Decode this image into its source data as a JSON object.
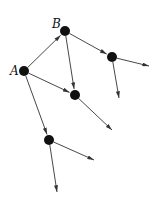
{
  "diagram": {
    "type": "directed-graph",
    "colors": {
      "node": "#111111",
      "edge": "#333333",
      "background": "#ffffff"
    },
    "nodes": [
      {
        "id": "A",
        "label": "A",
        "x": 24,
        "y": 71,
        "label_x": 10,
        "label_y": 75
      },
      {
        "id": "B",
        "label": "B",
        "x": 65,
        "y": 31,
        "label_x": 52,
        "label_y": 28
      },
      {
        "id": "C",
        "label": "",
        "x": 112,
        "y": 57
      },
      {
        "id": "D",
        "label": "",
        "x": 75,
        "y": 95
      },
      {
        "id": "E",
        "label": "",
        "x": 49,
        "y": 140
      }
    ],
    "edges": [
      {
        "from": "A",
        "to": "B"
      },
      {
        "from": "A",
        "to": "D"
      },
      {
        "from": "A",
        "to": "E"
      },
      {
        "from": "B",
        "to": "C"
      },
      {
        "from": "B",
        "to": "D"
      },
      {
        "from": "C",
        "to_point": [
          149,
          66
        ]
      },
      {
        "from": "C",
        "to_point": [
          119,
          98
        ]
      },
      {
        "from": "D",
        "to_point": [
          112,
          130
        ]
      },
      {
        "from": "E",
        "to_point": [
          94,
          160
        ]
      },
      {
        "from": "E",
        "to_point": [
          57,
          192
        ]
      }
    ]
  }
}
